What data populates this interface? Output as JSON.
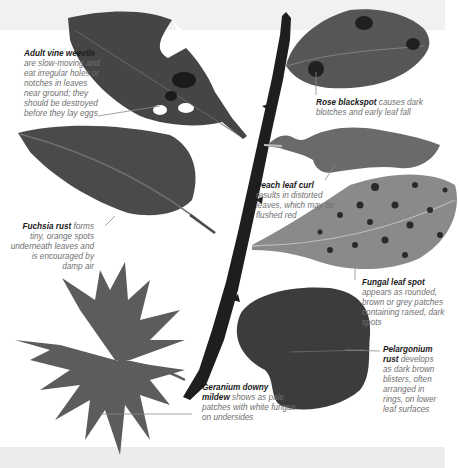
{
  "figure": {
    "background": "#ffffff",
    "band_color": "#eeeeee"
  },
  "captions": [
    {
      "id": "vine-weevil",
      "title": "Adult vine weevils",
      "text": " are slow-moving and eat irregular holes or notches in leaves near ground; they should be destroyed before they lay eggs"
    },
    {
      "id": "rose-blackspot",
      "title": "Rose blackspot",
      "text": " causes dark blotches and early leaf fall"
    },
    {
      "id": "fuchsia-rust",
      "title": "Fuchsia rust",
      "text": " forms tiny, orange spots underneath leaves and is encouraged by damp air"
    },
    {
      "id": "peach-leaf-curl",
      "title": "Peach leaf curl",
      "text": " results in distorted leaves, which may be flushed red"
    },
    {
      "id": "fungal-leaf-spot",
      "title": "Fungal leaf spot",
      "text": " appears as rounded, brown or grey patches containing raised, dark spots"
    },
    {
      "id": "pelargonium-rust",
      "title": "Pelargonium rust",
      "text": " develops as dark brown blisters, often arranged in rings, on lower leaf surfaces"
    },
    {
      "id": "geranium-downy-mildew",
      "title": "Geranium downy mildew",
      "text": " shows as pale patches with white fungus on undersides"
    }
  ],
  "colors": {
    "leaf_dark": "#3a3a3a",
    "leaf_mid": "#555555",
    "leaf_light": "#7a7a7a",
    "branch": "#1e1e1e",
    "leader_line": "#8a8a8a"
  }
}
